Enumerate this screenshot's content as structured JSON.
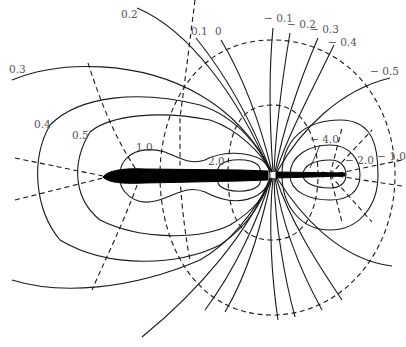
{
  "figure": {
    "line_style": {
      "solid": "contour lines",
      "dashed": "orthogonal field lines"
    },
    "colors": {
      "line": "#1a1a1a",
      "label": "#555555",
      "body": "#000000",
      "background": "#ffffff"
    }
  },
  "labels": {
    "top": {
      "l_0_2": "0.2",
      "l_0_1": "0.1",
      "l_0": "0",
      "l_m0_1": "− 0.1",
      "l_m0_2": "− 0.2",
      "l_m0_3": "− 0.3",
      "l_m0_4": "− 0.4",
      "l_m0_5": "− 0.5"
    },
    "left": {
      "l_0_3": "0.3",
      "l_0_4": "0.4",
      "l_0_5": "0.5"
    },
    "inner": {
      "l_1_0": "1.0",
      "l_2_0": "2.0",
      "l_m4_0": "− 4.0",
      "l_m2_0": "− 2.0",
      "l_m1_0": "− 1.0"
    }
  }
}
